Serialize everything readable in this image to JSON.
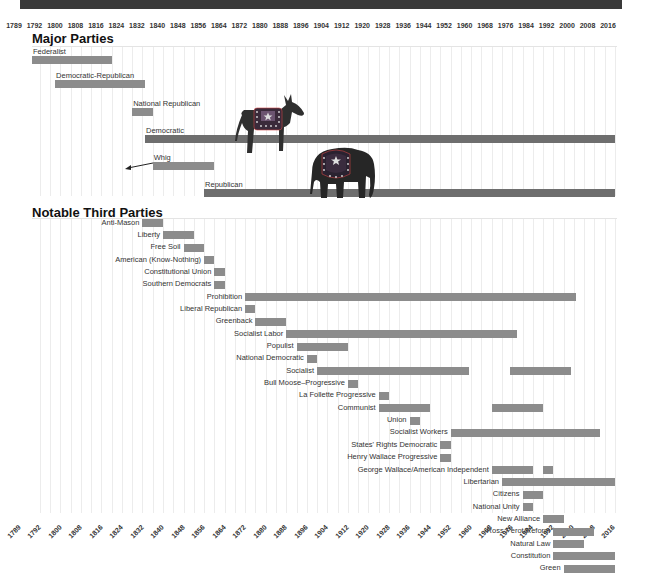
{
  "header": {
    "bar_color": "#3a3a3a"
  },
  "chart_data": {
    "type": "timeline",
    "title": "",
    "sections": [
      "Major Parties",
      "Notable Third Parties"
    ],
    "x_axis": {
      "min": 1789,
      "max": 2016,
      "tick_labels": [
        "1789",
        "1792",
        "1800",
        "1808",
        "1816",
        "1824",
        "1832",
        "1840",
        "1848",
        "1856",
        "1864",
        "1872",
        "1880",
        "1888",
        "1896",
        "1904",
        "1912",
        "1920",
        "1928",
        "1936",
        "1944",
        "1952",
        "1960",
        "1968",
        "1976",
        "1984",
        "1992",
        "2000",
        "2008",
        "2016"
      ]
    },
    "major_parties": [
      {
        "name": "Federalist",
        "spans": [
          [
            1789,
            1820
          ]
        ]
      },
      {
        "name": "Democratic-Republican",
        "spans": [
          [
            1798,
            1833
          ]
        ]
      },
      {
        "name": "National Republican",
        "spans": [
          [
            1828,
            1836
          ]
        ]
      },
      {
        "name": "Democratic",
        "spans": [
          [
            1833,
            2016
          ]
        ],
        "emphasis": true
      },
      {
        "name": "Whig",
        "spans": [
          [
            1836,
            1860
          ]
        ]
      },
      {
        "name": "Republican",
        "spans": [
          [
            1856,
            2016
          ]
        ],
        "emphasis": true
      }
    ],
    "third_parties": [
      {
        "name": "Anti-Mason",
        "spans": [
          [
            1832,
            1840
          ]
        ]
      },
      {
        "name": "Liberty",
        "spans": [
          [
            1840,
            1852
          ]
        ]
      },
      {
        "name": "Free Soil",
        "spans": [
          [
            1848,
            1856
          ]
        ]
      },
      {
        "name": "American (Know-Nothing)",
        "spans": [
          [
            1856,
            1860
          ]
        ]
      },
      {
        "name": "Constitutional Union",
        "spans": [
          [
            1860,
            1864
          ]
        ]
      },
      {
        "name": "Southern Democrats",
        "spans": [
          [
            1860,
            1864
          ]
        ]
      },
      {
        "name": "Prohibition",
        "spans": [
          [
            1872,
            2001
          ]
        ]
      },
      {
        "name": "Liberal Republican",
        "spans": [
          [
            1872,
            1876
          ]
        ]
      },
      {
        "name": "Greenback",
        "spans": [
          [
            1876,
            1888
          ]
        ]
      },
      {
        "name": "Socialist Labor",
        "spans": [
          [
            1888,
            1978
          ]
        ]
      },
      {
        "name": "Populist",
        "spans": [
          [
            1892,
            1912
          ]
        ]
      },
      {
        "name": "National Democratic",
        "spans": [
          [
            1896,
            1900
          ]
        ]
      },
      {
        "name": "Socialist",
        "spans": [
          [
            1900,
            1959
          ],
          [
            1975,
            1999
          ]
        ]
      },
      {
        "name": "Bull Moose–Progressive",
        "spans": [
          [
            1912,
            1916
          ]
        ]
      },
      {
        "name": "La Follette Progressive",
        "spans": [
          [
            1924,
            1928
          ]
        ]
      },
      {
        "name": "Communist",
        "spans": [
          [
            1924,
            1944
          ],
          [
            1968,
            1988
          ]
        ]
      },
      {
        "name": "Union",
        "spans": [
          [
            1936,
            1940
          ]
        ]
      },
      {
        "name": "Socialist Workers",
        "spans": [
          [
            1952,
            2010
          ]
        ]
      },
      {
        "name": "States' Rights Democratic",
        "spans": [
          [
            1948,
            1952
          ]
        ]
      },
      {
        "name": "Henry Wallace Progressive",
        "spans": [
          [
            1948,
            1952
          ]
        ]
      },
      {
        "name": "George Wallace/American Independent",
        "spans": [
          [
            1968,
            1984
          ],
          [
            1988,
            1992
          ]
        ]
      },
      {
        "name": "Libertarian",
        "spans": [
          [
            1972,
            2016
          ]
        ]
      },
      {
        "name": "Citizens",
        "spans": [
          [
            1980,
            1988
          ]
        ]
      },
      {
        "name": "National Unity",
        "spans": [
          [
            1980,
            1984
          ]
        ]
      },
      {
        "name": "New Alliance",
        "spans": [
          [
            1988,
            1996
          ]
        ]
      },
      {
        "name": "Ross Perot/Reform",
        "spans": [
          [
            1992,
            2008
          ]
        ]
      },
      {
        "name": "Natural Law",
        "spans": [
          [
            1992,
            2004
          ]
        ]
      },
      {
        "name": "Constitution",
        "spans": [
          [
            1992,
            2016
          ]
        ]
      },
      {
        "name": "Green",
        "spans": [
          [
            1996,
            2016
          ]
        ]
      }
    ],
    "colors": {
      "bar": "#8c8c8c",
      "major_bar": "#6e6e6e",
      "grid": "#ececec"
    },
    "annotations": [
      "donkey mascot above Democratic bar",
      "elephant mascot above Republican bar",
      "arrow pointing left from Whig bar"
    ]
  },
  "labels": {
    "major_title": "Major Parties",
    "third_title": "Notable Third Parties"
  }
}
